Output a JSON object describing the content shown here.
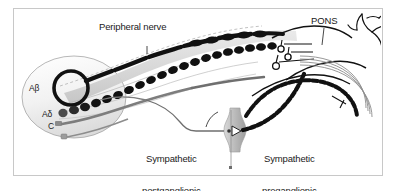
{
  "figure": {
    "domain": "diagram",
    "background_color": "#ffffff",
    "frame_color": "#c8c8c8",
    "ink_color": "#111111",
    "fill_gray": "#cfcfcf",
    "fill_light": "#e8e8e8"
  },
  "labels": {
    "peripheral_nerve": "Peripheral nerve",
    "pons": "PONS",
    "a_beta": "Aβ",
    "a_delta": "Aδ",
    "c_fiber": "C",
    "sympathetic_postganglionic_line1": "Sympathetic",
    "sympathetic_postganglionic_line2": "postganglionic",
    "sympathetic_preganglionic_line1": "Sympathetic",
    "sympathetic_preganglionic_line2": "preganglionic"
  },
  "structures": {
    "receptive_field": "skin-receptive-field-oval",
    "a_beta_ending": "coiled-encapsulated-ending",
    "a_delta_ending": "beaded-thin-myelinated-ending",
    "c_ending": "unmyelinated-free-nerve-ending",
    "nerve_trunk": "peripheral-nerve-trunk",
    "dorsal_root_ganglion": "dorsal-root-ganglion-cell-bodies",
    "spinal_cord": "spinal-cord-brainstem",
    "sympathetic_ganglion": "sympathetic-chain-ganglion",
    "synapse": "ganglionic-synapse-arrow",
    "ascending_tracts": "ascending-sensory-tracts",
    "brain_branches": "supraspinal-branching-terminals"
  }
}
